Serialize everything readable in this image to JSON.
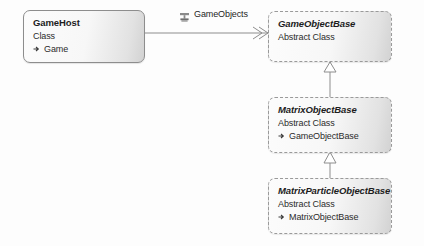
{
  "diagram": {
    "type": "uml-class-diagram",
    "background_color": "#fdfdfd",
    "boxes": [
      {
        "id": "gamehost",
        "name": "GameHost",
        "kind": "Class",
        "stereotype": "concrete",
        "members": [
          {
            "marker": "property-icon",
            "label": "Game"
          }
        ]
      },
      {
        "id": "gameobjectbase",
        "name": "GameObjectBase",
        "kind": "Abstract Class",
        "stereotype": "abstract",
        "members": []
      },
      {
        "id": "matrixobjectbase",
        "name": "MatrixObjectBase",
        "kind": "Abstract Class",
        "stereotype": "abstract",
        "members": [
          {
            "marker": "inherit-icon",
            "label": "GameObjectBase"
          }
        ]
      },
      {
        "id": "matrixparticleobjectbase",
        "name": "MatrixParticleObjectBase",
        "kind": "Abstract Class",
        "stereotype": "abstract",
        "members": [
          {
            "marker": "inherit-icon",
            "label": "MatrixObjectBase"
          }
        ]
      }
    ],
    "associations": [
      {
        "id": "gameobjects",
        "label": "GameObjects",
        "icon": "collection-association-icon",
        "from": "gamehost",
        "to": "gameobjectbase",
        "arrow": "open-double-chevron"
      }
    ],
    "inheritances": [
      {
        "id": "matrixobjectbase-to-gameobjectbase",
        "from": "matrixobjectbase",
        "to": "gameobjectbase",
        "arrow": "hollow-triangle"
      },
      {
        "id": "matrixparticleobjectbase-to-matrixobjectbase",
        "from": "matrixparticleobjectbase",
        "to": "matrixobjectbase",
        "arrow": "hollow-triangle"
      }
    ],
    "colors": {
      "line": "#8d8d8d",
      "border_concrete": "#8d8d8d",
      "border_abstract": "#9a9a9a",
      "text": "#1d1d1d",
      "fill_light": "#fcfcfc",
      "fill_dark": "#d2d2d2"
    }
  }
}
